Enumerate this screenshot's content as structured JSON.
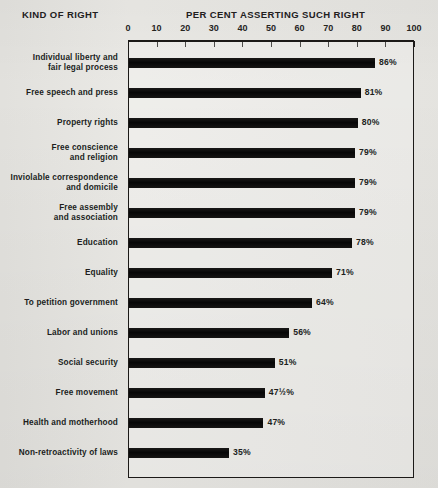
{
  "headers": {
    "left": "KIND OF RIGHT",
    "right": "PER CENT ASSERTING SUCH RIGHT"
  },
  "axis": {
    "ticks": [
      "0",
      "10",
      "20",
      "30",
      "40",
      "50",
      "60",
      "70",
      "80",
      "90",
      "100"
    ]
  },
  "colors": {
    "background": "#e9e8e4",
    "bar": "#111010",
    "frame": "#1c1a18",
    "text": "#201e1c"
  },
  "chart_data": {
    "type": "bar",
    "orientation": "horizontal",
    "title": "PER CENT ASSERTING SUCH RIGHT",
    "xlabel": "PER CENT ASSERTING SUCH RIGHT",
    "ylabel": "KIND OF RIGHT",
    "xlim": [
      0,
      100
    ],
    "xticks": [
      0,
      10,
      20,
      30,
      40,
      50,
      60,
      70,
      80,
      90,
      100
    ],
    "grid": false,
    "legend": false,
    "categories": [
      "Individual liberty and fair legal process",
      "Free speech and press",
      "Property rights",
      "Free conscience and religion",
      "Inviolable correspondence and domicile",
      "Free assembly and association",
      "Education",
      "Equality",
      "To petition government",
      "Labor and unions",
      "Social security",
      "Free movement",
      "Health and motherhood",
      "Non-retroactivity of laws"
    ],
    "values": [
      86,
      81,
      80,
      79,
      79,
      79,
      78,
      71,
      64,
      56,
      51,
      47.5,
      47,
      35
    ],
    "value_labels": [
      "86%",
      "81%",
      "80%",
      "79%",
      "79%",
      "79%",
      "78%",
      "71%",
      "64%",
      "56%",
      "51%",
      "47½%",
      "47%",
      "35%"
    ]
  },
  "rows": [
    {
      "lines": [
        "Individual liberty and",
        "fair legal process"
      ],
      "value": 86,
      "label": "86%"
    },
    {
      "lines": [
        "Free speech and press"
      ],
      "value": 81,
      "label": "81%"
    },
    {
      "lines": [
        "Property rights"
      ],
      "value": 80,
      "label": "80%"
    },
    {
      "lines": [
        "Free conscience",
        "and religion"
      ],
      "value": 79,
      "label": "79%"
    },
    {
      "lines": [
        "Inviolable correspondence",
        "and domicile"
      ],
      "value": 79,
      "label": "79%"
    },
    {
      "lines": [
        "Free assembly",
        "and association"
      ],
      "value": 79,
      "label": "79%"
    },
    {
      "lines": [
        "Education"
      ],
      "value": 78,
      "label": "78%"
    },
    {
      "lines": [
        "Equality"
      ],
      "value": 71,
      "label": "71%"
    },
    {
      "lines": [
        "To petition government"
      ],
      "value": 64,
      "label": "64%"
    },
    {
      "lines": [
        "Labor and unions"
      ],
      "value": 56,
      "label": "56%"
    },
    {
      "lines": [
        "Social security"
      ],
      "value": 51,
      "label": "51%"
    },
    {
      "lines": [
        "Free movement"
      ],
      "value": 47.5,
      "label": "47½%"
    },
    {
      "lines": [
        "Health and motherhood"
      ],
      "value": 47,
      "label": "47%"
    },
    {
      "lines": [
        "Non-retroactivity of laws"
      ],
      "value": 35,
      "label": "35%"
    }
  ]
}
